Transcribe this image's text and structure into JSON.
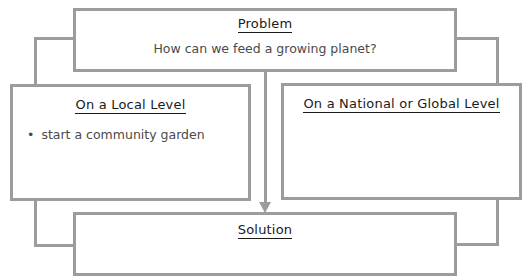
{
  "problem": {
    "heading": "Problem",
    "question": "How can we feed a growing planet?"
  },
  "local": {
    "heading": "On a Local Level",
    "items": [
      "start a community garden"
    ]
  },
  "global": {
    "heading": "On a National or Global Level",
    "items": []
  },
  "solution": {
    "heading": "Solution",
    "text": ""
  },
  "colors": {
    "border": "#9c9c9c",
    "heading_text": "#1a1a1a",
    "body_text": "#4a4a4a"
  }
}
